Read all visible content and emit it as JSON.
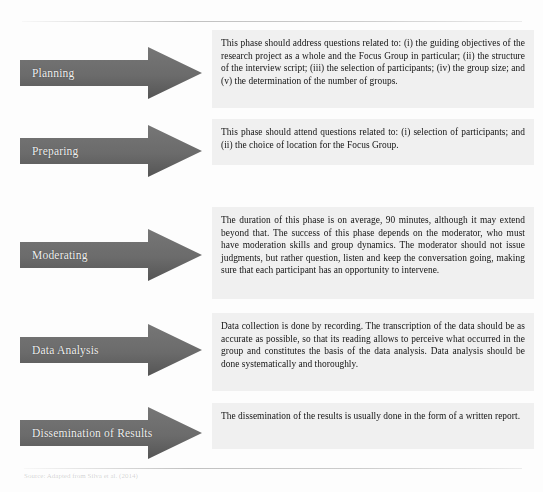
{
  "figure": {
    "arrow_fill_start": "#6f6f6f",
    "arrow_fill_end": "#575757",
    "arrow_label_color": "#f2f2f2",
    "panel_background": "#ececec",
    "panel_text_color": "#171717",
    "page_background": "#fdfdfd"
  },
  "caption": {
    "text": "Source: Adapted from Silva et al. (2014)"
  },
  "rows": [
    {
      "phase": "Planning",
      "text": "This phase should address questions related to: (i) the guiding objectives of the research project as a whole and the Focus Group in particular; (ii) the structure of the interview script; (iii) the selection of participants; (iv) the group size; and (v) the determination of the number of groups."
    },
    {
      "phase": "Preparing",
      "text": "This phase should attend questions related to: (i) selection of participants; and (ii) the choice of location for the Focus Group."
    },
    {
      "phase": "Moderating",
      "text": "The duration of this phase is on average, 90 minutes, although it may extend beyond that. The success of this phase depends on the moderator, who must have moderation skills and group dynamics. The moderator should not issue judgments, but rather question, listen and keep the conversation going, making sure that each participant has an opportunity to intervene."
    },
    {
      "phase": "Data Analysis",
      "text": "Data collection is done by recording. The transcription of the data should be as accurate as possible, so that its reading allows to perceive what occurred in the group and constitutes the basis of the data analysis. Data analysis should be done systematically and thoroughly."
    },
    {
      "phase": "Dissemination of Results",
      "text": "The dissemination of the results is usually done in the form of a written report."
    }
  ]
}
